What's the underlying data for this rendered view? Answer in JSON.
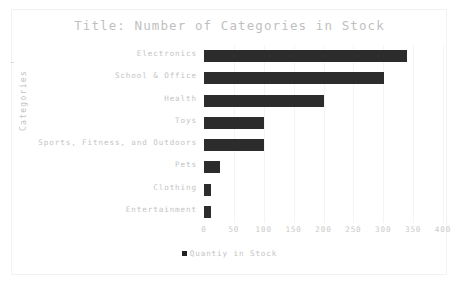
{
  "chart_data": {
    "type": "bar",
    "orientation": "horizontal",
    "title": "Title: Number of Categories in Stock",
    "xlabel": "",
    "ylabel": "Categories",
    "categories": [
      "Electronics",
      "School & Office",
      "Health",
      "Toys",
      "Sports, Fitness, and Outdoors",
      "Pets",
      "Clothing",
      "Entertainment"
    ],
    "values": [
      339,
      302,
      200,
      100,
      100,
      27,
      12,
      12
    ],
    "series": [
      {
        "name": "Quantiy in Stock",
        "values": [
          339,
          302,
          200,
          100,
          100,
          27,
          12,
          12
        ]
      }
    ],
    "xlim": [
      0,
      400
    ],
    "xticks": [
      0,
      50,
      100,
      150,
      200,
      250,
      300,
      350,
      400
    ],
    "xtick_labels": [
      "0",
      "50",
      "100",
      "150",
      "200",
      "250",
      "300",
      "350",
      "400"
    ],
    "grid": "vertical",
    "legend": {
      "position": "bottom-center",
      "entries": [
        {
          "label": "Quantiy in Stock",
          "marker": "square",
          "color": "#222222"
        }
      ]
    },
    "colors": {
      "bar": "#2c2c2c",
      "background": "#ffffff",
      "gridline": "#f4f4f4",
      "text": "#c4c4c4",
      "title_text": "#bfbfbf",
      "frame": "#f2f2f2"
    }
  }
}
